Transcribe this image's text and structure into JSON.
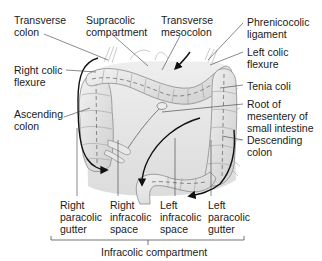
{
  "figure": {
    "type": "anatomical-diagram"
  },
  "labels": {
    "transverse_colon": "Transverse\ncolon",
    "supracolic_compartment": "Supracolic\ncompartment",
    "transverse_mesocolon": "Transverse\nmesocolon",
    "phrenicocolic_ligament": "Phrenicocolic\nligament",
    "left_colic_flexure": "Left colic\nflexure",
    "right_colic_flexure": "Right colic\nflexure",
    "tenia_coli": "Tenia coli",
    "ascending_colon": "Ascending\ncolon",
    "root_of_mesentery": "Root of\nmesentery of\nsmall intestine",
    "descending_colon": "Descending\ncolon",
    "right_paracolic_gutter": "Right\nparacolic\ngutter",
    "right_infracolic_space": "Right\ninfracolic\nspace",
    "left_infracolic_space": "Left\ninfracolic\nspace",
    "left_paracolic_gutter": "Left\nparacolic\ngutter",
    "infracolic_compartment": "Infracolic compartment"
  },
  "colors": {
    "line": "#3a3a3a",
    "arrow": "#111111",
    "organ_fill": "#e4e4e4",
    "organ_shade": "#c9c9c9",
    "organ_stroke": "#8a8a8a",
    "tenia": "#6e6e6e",
    "background": "#ffffff"
  }
}
